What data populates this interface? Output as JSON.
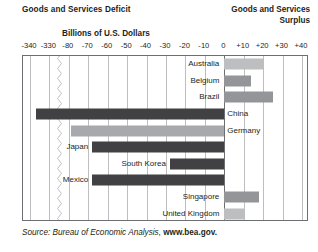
{
  "header": {
    "left_title": "Goods and Services Deficit",
    "right_title_line1": "Goods and Services",
    "right_title_line2": "Surplus"
  },
  "source": {
    "prefix": "Source: Bureau of Economic Analysis, ",
    "site": "www.bea.gov."
  },
  "colors": {
    "deficit_dark": "#414042",
    "deficit_light": "#a7a9ac",
    "surplus_light": "#bcbec0",
    "surplus_mid": "#939598",
    "grid": "#bcbec0",
    "frame": "#6d6e71",
    "text": "#231f20"
  },
  "chart_data": {
    "type": "bar",
    "orientation": "horizontal",
    "title": "Billions of U.S. Dollars",
    "xlabel": "Billions of U.S. Dollars",
    "ylabel": "",
    "grid": true,
    "legend": "none",
    "axis_break": {
      "between": [
        -330,
        -80
      ],
      "style": "zigzag"
    },
    "tick_labels": [
      "-340",
      "-330",
      "-80",
      "-70",
      "-60",
      "-50",
      "-40",
      "-30",
      "-20",
      "-10",
      "0",
      "+10",
      "+20",
      "+30",
      "+40"
    ],
    "tick_values": [
      -340,
      -330,
      -80,
      -70,
      -60,
      -50,
      -40,
      -30,
      -20,
      -10,
      0,
      10,
      20,
      30,
      40
    ],
    "xlim": [
      -345,
      45
    ],
    "categories": [
      "Australia",
      "Belgium",
      "Brazil",
      "China",
      "Germany",
      "Japan",
      "South Korea",
      "Mexico",
      "Singapore",
      "United Kingdom"
    ],
    "values": [
      20,
      14,
      25,
      -337,
      -79,
      -68,
      -28,
      -68,
      18,
      10
    ],
    "bars": [
      {
        "label": "Australia",
        "value": 20,
        "kind": "surplus",
        "shade": "light"
      },
      {
        "label": "Belgium",
        "value": 14,
        "kind": "surplus",
        "shade": "mid"
      },
      {
        "label": "Brazil",
        "value": 25,
        "kind": "surplus",
        "shade": "mid"
      },
      {
        "label": "China",
        "value": -337,
        "kind": "deficit",
        "shade": "dark"
      },
      {
        "label": "Germany",
        "value": -79,
        "kind": "deficit",
        "shade": "light"
      },
      {
        "label": "Japan",
        "value": -68,
        "kind": "deficit",
        "shade": "dark"
      },
      {
        "label": "South Korea",
        "value": -28,
        "kind": "deficit",
        "shade": "dark"
      },
      {
        "label": "Mexico",
        "value": -68,
        "kind": "deficit",
        "shade": "dark"
      },
      {
        "label": "Singapore",
        "value": 18,
        "kind": "surplus",
        "shade": "mid"
      },
      {
        "label": "United Kingdom",
        "value": 10,
        "kind": "surplus",
        "shade": "light"
      }
    ]
  }
}
